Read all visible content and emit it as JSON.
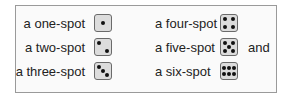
{
  "dice": [
    {
      "label": "a one-spot",
      "spots": 1
    },
    {
      "label": "a two-spot",
      "spots": 2
    },
    {
      "label": "a three-spot",
      "spots": 3
    },
    {
      "label": "a four-spot",
      "spots": 4
    },
    {
      "label": "a five-spot",
      "spots": 5
    },
    {
      "label": "a six-spot",
      "spots": 6
    }
  ],
  "trailing_text": "and",
  "colors": {
    "border": "#9a9a9a",
    "die_face": "#dcdcdc",
    "pip": "#111111"
  }
}
